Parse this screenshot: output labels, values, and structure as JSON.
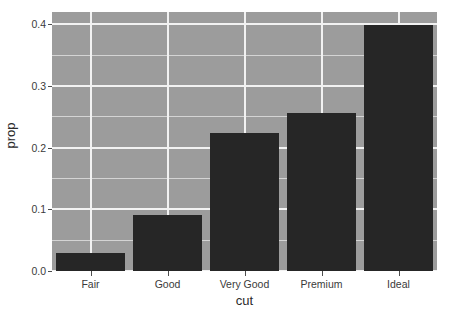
{
  "chart_data": {
    "type": "bar",
    "title": "",
    "subtitle": "",
    "xlabel": "cut",
    "ylabel": "prop",
    "categories": [
      "Fair",
      "Good",
      "Very Good",
      "Premium",
      "Ideal"
    ],
    "values": [
      0.0298,
      0.091,
      0.224,
      0.2557,
      0.3995
    ],
    "series": [
      {
        "name": "prop",
        "values": [
          0.0298,
          0.091,
          0.224,
          0.2557,
          0.3995
        ]
      }
    ],
    "ylim": [
      0,
      0.42
    ],
    "ytick_labels": [
      "0.0",
      "0.1",
      "0.2",
      "0.3",
      "0.4"
    ],
    "ytick_values": [
      0.0,
      0.1,
      0.2,
      0.3,
      0.4
    ],
    "yminor_values": [
      0.05,
      0.15,
      0.25,
      0.35
    ],
    "xtick_labels": [
      "Fair",
      "Good",
      "Very Good",
      "Premium",
      "Ideal"
    ],
    "grid": true,
    "legend": "none",
    "bar_width_fraction": 0.9,
    "colors": {
      "bar_fill": "#262626",
      "panel_background": "#9c9c9c",
      "major_gridline": "#f2f2f2",
      "minor_gridline": "#d4d4d4",
      "axis_text": "#3a3a3a",
      "axis_title": "#2b2b2b",
      "figure_background": "#ffffff"
    }
  }
}
